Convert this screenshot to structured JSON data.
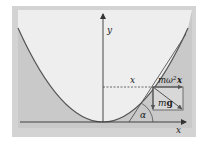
{
  "figure": {
    "type": "physics-diagram",
    "colors": {
      "outer_frame": "#d3d3d3",
      "inner_panel": "#eeeeee",
      "shaded_region": "#c9c9c9",
      "curve": "#555555",
      "axis": "#333333"
    },
    "axes": {
      "y_label": "y",
      "x_label": "x"
    },
    "labels": {
      "horizontal_distance": "x",
      "centrifugal_force": "mω²x",
      "centrifugal_force_mass": "mω",
      "centrifugal_force_exp": "2",
      "centrifugal_force_var": "x",
      "gravity_force": "mg",
      "gravity_force_m": "m",
      "gravity_force_g": "g",
      "tangent_angle": "α"
    }
  }
}
